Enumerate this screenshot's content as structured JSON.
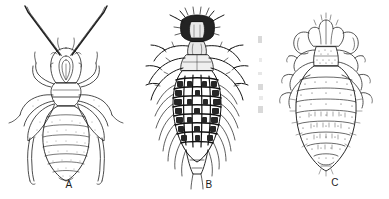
{
  "plate": {
    "title": "Dorsal-view line drawings of three ectoparasitic lice",
    "background_color": "#ffffff",
    "ink_color": "#1b1b1b",
    "width": 389,
    "height": 199,
    "medium": "scanned pen-and-ink scientific illustration",
    "view": "dorsal",
    "panel_count": 3
  },
  "figures": [
    {
      "label": "A",
      "name": "figure-a",
      "description": "Slender pale louse in dorsal view with two very long antennae reaching the top of the frame, a narrow head, three pairs of outspread legs with stippled femora, and an elongate oval abdomen with about eight transverse segment bands tapering to a pointed tip.",
      "shading": "light outline with fine stipple",
      "antennae": "long, two, extending beyond head to image top",
      "abdomen_segments": 8,
      "leg_pairs": 3,
      "body_outline": "elongate-oval, tapering posteriorly"
    },
    {
      "label": "B",
      "name": "figure-b",
      "description": "Heavily sclerotized dark louse in dorsal view with a small blocky head bearing short antennae, a narrow thorax, three pairs of spiny legs spread laterally, and a broad abdomen marked by a dense dark rectangular grid of plates fringed with long lateral setae.",
      "shading": "dense black, strongly sclerotized",
      "antennae": "short, two, segmented",
      "abdomen_segments": 9,
      "leg_pairs": 3,
      "body_outline": "oval with grid-patterned tergal plates and long marginal setae"
    },
    {
      "label": "C",
      "name": "figure-c",
      "description": "Broad pear-shaped louse in dorsal view with a lobed crown-like head, short antennae, a trapezoidal stippled thorax, three pairs of short stout legs held close to the body, and a wide rounded abdomen with stippled transverse segments bearing small setae.",
      "shading": "fine stipple with outlined segments",
      "antennae": "short, two",
      "abdomen_segments": 8,
      "leg_pairs": 3,
      "body_outline": "broad oval, widest at mid-abdomen"
    }
  ],
  "captions": {
    "a": "A",
    "b": "B",
    "c": "C"
  },
  "artifacts": {
    "note": "faint vertical grey scan smudges along the left margin of panel C"
  }
}
